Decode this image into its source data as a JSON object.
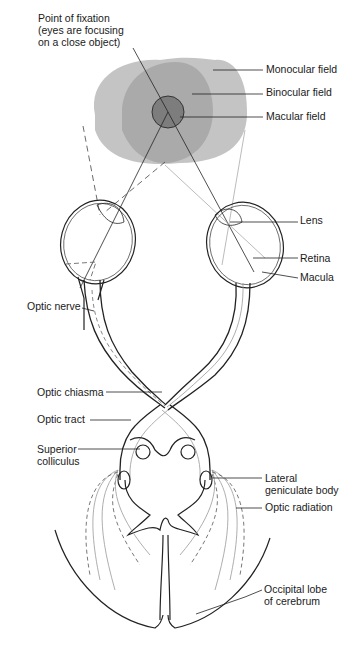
{
  "diagram": {
    "labels": {
      "fixation_line1": "Point of fixation",
      "fixation_line2": "(eyes are focusing",
      "fixation_line3": "on a close object)",
      "monocular": "Monocular field",
      "binocular": "Binocular field",
      "macular": "Macular field",
      "lens": "Lens",
      "retina": "Retina",
      "macula": "Macula",
      "optic_nerve": "Optic nerve",
      "optic_chiasma": "Optic chiasma",
      "optic_tract": "Optic tract",
      "superior_line1": "Superior",
      "superior_line2": "colliculus",
      "lgb_line1": "Lateral",
      "lgb_line2": "geniculate body",
      "optic_radiation": "Optic radiation",
      "occipital_line1": "Occipital lobe",
      "occipital_line2": "of cerebrum"
    },
    "colors": {
      "monocular_field": "#bdbdbd",
      "binocular_field": "#a6a6a6",
      "macular_field": "#7a7a7a",
      "line": "#222222",
      "grey_line": "#9a9a9a"
    }
  }
}
